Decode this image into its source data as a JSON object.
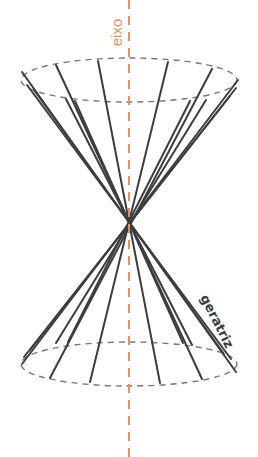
{
  "diagram": {
    "type": "double-cone",
    "labels": {
      "axis": "eixo",
      "generatrix": "geratriz"
    },
    "colors": {
      "axis": "#E8925A",
      "lines": "#3d3d3d",
      "ellipse": "#777777",
      "background": "#ffffff"
    },
    "apex": [
      129,
      222
    ],
    "top_ellipse": {
      "cx": 129,
      "cy": 80,
      "rx": 108,
      "ry": 22
    },
    "bottom_ellipse": {
      "cx": 129,
      "cy": 364,
      "rx": 108,
      "ry": 22
    }
  }
}
